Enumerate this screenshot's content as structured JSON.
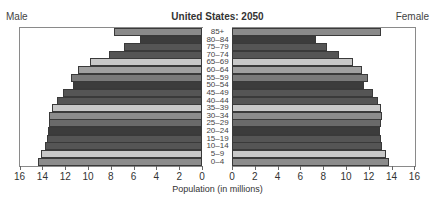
{
  "chart_data": {
    "type": "bar",
    "subtype": "population-pyramid",
    "title": "United States: 2050",
    "xlabel": "Population (in millions)",
    "ylabel": "",
    "left_label": "Male",
    "right_label": "Female",
    "xlim": [
      0,
      16
    ],
    "x_ticks": [
      0,
      2,
      4,
      6,
      8,
      10,
      12,
      14,
      16
    ],
    "grid": false,
    "legend": "none",
    "categories": [
      "85+",
      "80–84",
      "75–79",
      "70–74",
      "65–69",
      "60–64",
      "55–59",
      "50–54",
      "45–49",
      "40–44",
      "35–39",
      "30–34",
      "25–29",
      "20–24",
      "15–19",
      "10–14",
      "5–9",
      "0–4"
    ],
    "series": [
      {
        "name": "Male",
        "values": [
          7.7,
          5.4,
          6.8,
          8.2,
          9.8,
          10.9,
          11.5,
          11.3,
          12.2,
          12.7,
          13.2,
          13.4,
          13.4,
          13.5,
          13.6,
          13.8,
          14.1,
          14.4
        ]
      },
      {
        "name": "Female",
        "values": [
          13.1,
          7.4,
          8.3,
          9.4,
          10.6,
          11.4,
          11.9,
          11.6,
          12.4,
          12.8,
          13.1,
          13.2,
          13.1,
          13.0,
          13.1,
          13.2,
          13.5,
          13.8
        ]
      }
    ],
    "bar_colors": [
      "#8a8a8a",
      "#3c3c3c",
      "#555555",
      "#555555",
      "#c8c8c8",
      "#a0a0a0",
      "#7a7a7a",
      "#3c3c3c",
      "#555555",
      "#555555",
      "#c8c8c8",
      "#8c8c8c",
      "#6a6a6a",
      "#3c3c3c",
      "#555555",
      "#555555",
      "#c8c8c8",
      "#8c8c8c"
    ]
  }
}
